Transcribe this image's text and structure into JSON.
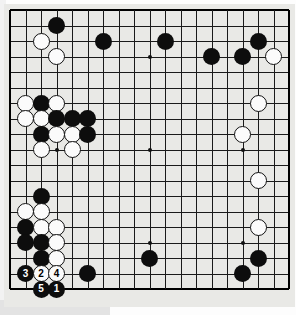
{
  "app": {
    "title": "Go Board Diagram",
    "type": "go-game-diagram"
  },
  "board": {
    "size": 19,
    "background_color": "#e9e9e6",
    "line_color": "#1a1a1a",
    "black_color": "#0d0d0d",
    "white_color": "#fbfbfb",
    "star_points": [
      {
        "col": 3,
        "row": 3
      },
      {
        "col": 9,
        "row": 3
      },
      {
        "col": 15,
        "row": 3
      },
      {
        "col": 3,
        "row": 9
      },
      {
        "col": 9,
        "row": 9
      },
      {
        "col": 15,
        "row": 9
      },
      {
        "col": 3,
        "row": 15
      },
      {
        "col": 9,
        "row": 15
      },
      {
        "col": 15,
        "row": 15
      }
    ],
    "geometry": {
      "origin_x": 10,
      "origin_y": 10,
      "cell": 15.5,
      "stone_diameter": 17
    }
  },
  "stones": [
    {
      "col": 3,
      "row": 1,
      "color": "black",
      "label": ""
    },
    {
      "col": 2,
      "row": 2,
      "color": "white",
      "label": ""
    },
    {
      "col": 6,
      "row": 2,
      "color": "black",
      "label": ""
    },
    {
      "col": 10,
      "row": 2,
      "color": "black",
      "label": ""
    },
    {
      "col": 16,
      "row": 2,
      "color": "black",
      "label": ""
    },
    {
      "col": 3,
      "row": 3,
      "color": "white",
      "label": ""
    },
    {
      "col": 13,
      "row": 3,
      "color": "black",
      "label": ""
    },
    {
      "col": 15,
      "row": 3,
      "color": "black",
      "label": ""
    },
    {
      "col": 17,
      "row": 3,
      "color": "white",
      "label": ""
    },
    {
      "col": 1,
      "row": 6,
      "color": "white",
      "label": ""
    },
    {
      "col": 2,
      "row": 6,
      "color": "black",
      "label": ""
    },
    {
      "col": 3,
      "row": 6,
      "color": "white",
      "label": ""
    },
    {
      "col": 16,
      "row": 6,
      "color": "white",
      "label": ""
    },
    {
      "col": 1,
      "row": 7,
      "color": "white",
      "label": ""
    },
    {
      "col": 2,
      "row": 7,
      "color": "white",
      "label": ""
    },
    {
      "col": 3,
      "row": 7,
      "color": "black",
      "label": ""
    },
    {
      "col": 4,
      "row": 7,
      "color": "black",
      "label": ""
    },
    {
      "col": 5,
      "row": 7,
      "color": "black",
      "label": ""
    },
    {
      "col": 2,
      "row": 8,
      "color": "black",
      "label": ""
    },
    {
      "col": 3,
      "row": 8,
      "color": "white",
      "label": ""
    },
    {
      "col": 4,
      "row": 8,
      "color": "white",
      "label": ""
    },
    {
      "col": 5,
      "row": 8,
      "color": "black",
      "label": ""
    },
    {
      "col": 15,
      "row": 8,
      "color": "white",
      "label": ""
    },
    {
      "col": 2,
      "row": 9,
      "color": "white",
      "label": ""
    },
    {
      "col": 4,
      "row": 9,
      "color": "white",
      "label": ""
    },
    {
      "col": 16,
      "row": 11,
      "color": "white",
      "label": ""
    },
    {
      "col": 2,
      "row": 12,
      "color": "black",
      "label": ""
    },
    {
      "col": 1,
      "row": 13,
      "color": "white",
      "label": ""
    },
    {
      "col": 2,
      "row": 13,
      "color": "white",
      "label": ""
    },
    {
      "col": 1,
      "row": 14,
      "color": "black",
      "label": ""
    },
    {
      "col": 2,
      "row": 14,
      "color": "white",
      "label": ""
    },
    {
      "col": 3,
      "row": 14,
      "color": "white",
      "label": ""
    },
    {
      "col": 16,
      "row": 14,
      "color": "white",
      "label": ""
    },
    {
      "col": 1,
      "row": 15,
      "color": "black",
      "label": ""
    },
    {
      "col": 2,
      "row": 15,
      "color": "black",
      "label": ""
    },
    {
      "col": 3,
      "row": 15,
      "color": "white",
      "label": ""
    },
    {
      "col": 2,
      "row": 16,
      "color": "black",
      "label": ""
    },
    {
      "col": 3,
      "row": 16,
      "color": "white",
      "label": ""
    },
    {
      "col": 9,
      "row": 16,
      "color": "black",
      "label": ""
    },
    {
      "col": 16,
      "row": 16,
      "color": "black",
      "label": ""
    },
    {
      "col": 1,
      "row": 17,
      "color": "black",
      "label": "3"
    },
    {
      "col": 2,
      "row": 17,
      "color": "white",
      "label": "2"
    },
    {
      "col": 3,
      "row": 17,
      "color": "white",
      "label": "4"
    },
    {
      "col": 5,
      "row": 17,
      "color": "black",
      "label": ""
    },
    {
      "col": 15,
      "row": 17,
      "color": "black",
      "label": ""
    },
    {
      "col": 2,
      "row": 18,
      "color": "black",
      "label": "5"
    },
    {
      "col": 3,
      "row": 18,
      "color": "black",
      "label": "1"
    }
  ],
  "move_sequence": [
    {
      "label": "1",
      "color": "black",
      "col": 3,
      "row": 18
    },
    {
      "label": "2",
      "color": "white",
      "col": 2,
      "row": 17
    },
    {
      "label": "3",
      "color": "black",
      "col": 1,
      "row": 17
    },
    {
      "label": "4",
      "color": "white",
      "col": 3,
      "row": 17
    },
    {
      "label": "5",
      "color": "black",
      "col": 2,
      "row": 18
    }
  ]
}
